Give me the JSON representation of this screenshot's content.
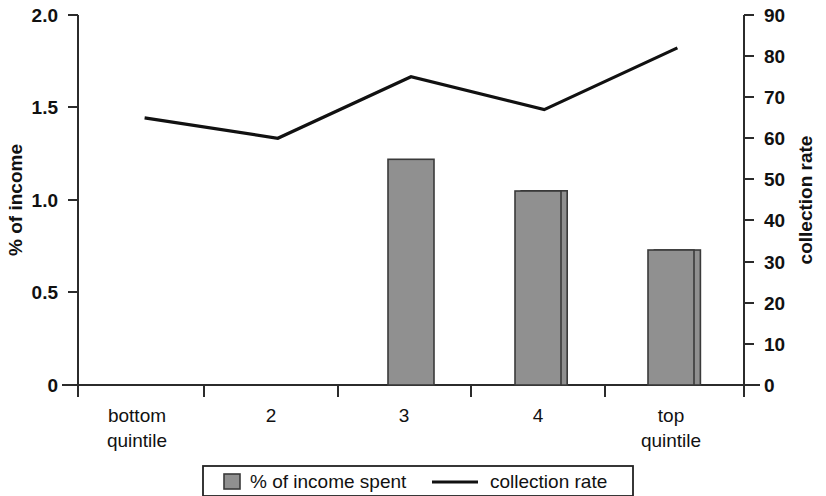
{
  "chart_data": {
    "type": "bar",
    "title": "",
    "subtitle": "",
    "xlabel": "",
    "categories": [
      "bottom quintile",
      "2",
      "3",
      "4",
      "top quintile"
    ],
    "category_lines": [
      [
        "bottom",
        "quintile"
      ],
      [
        "2"
      ],
      [
        "3"
      ],
      [
        "4"
      ],
      [
        "top",
        "quintile"
      ]
    ],
    "grid": false,
    "legend_position": "bottom",
    "axes": {
      "left": {
        "label": "% of income",
        "ticks": [
          "0",
          "0.5",
          "1.0",
          "1.5",
          "2.0"
        ],
        "tick_values": [
          0,
          0.5,
          1.0,
          1.5,
          2.0
        ],
        "ylim": [
          0,
          2.0
        ]
      },
      "right": {
        "label": "collection rate",
        "ticks": [
          "0",
          "10",
          "20",
          "30",
          "40",
          "50",
          "60",
          "70",
          "80",
          "90"
        ],
        "tick_values": [
          0,
          10,
          20,
          30,
          40,
          50,
          60,
          70,
          80,
          90
        ],
        "ylim": [
          0,
          90
        ]
      }
    },
    "series": [
      {
        "name": "% of income spent",
        "type": "bar",
        "axis": "left",
        "color": "#909090",
        "values": [
          1.84,
          1.42,
          1.22,
          1.05,
          0.73
        ]
      },
      {
        "name": "collection rate",
        "type": "line",
        "axis": "right",
        "color": "#111111",
        "values": [
          65,
          60,
          75,
          67,
          82
        ]
      }
    ],
    "legend": [
      {
        "label": "% of income spent",
        "marker": "square",
        "color": "#909090"
      },
      {
        "label": "collection rate",
        "marker": "line",
        "color": "#111111"
      }
    ]
  }
}
